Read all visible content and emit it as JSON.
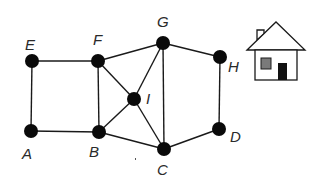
{
  "diagram": {
    "type": "graph",
    "nodes": [
      {
        "id": "E",
        "label": "E",
        "x": 32,
        "y": 61,
        "lx": 25,
        "ly": 50
      },
      {
        "id": "F",
        "label": "F",
        "x": 98,
        "y": 61,
        "lx": 93,
        "ly": 45
      },
      {
        "id": "G",
        "label": "G",
        "x": 163,
        "y": 43,
        "lx": 157,
        "ly": 27
      },
      {
        "id": "H",
        "label": "H",
        "x": 220,
        "y": 57,
        "lx": 228,
        "ly": 72
      },
      {
        "id": "I",
        "label": "I",
        "x": 134,
        "y": 99,
        "lx": 146,
        "ly": 104
      },
      {
        "id": "A",
        "label": "A",
        "x": 31,
        "y": 131,
        "lx": 22,
        "ly": 159
      },
      {
        "id": "B",
        "label": "B",
        "x": 99,
        "y": 132,
        "lx": 89,
        "ly": 157
      },
      {
        "id": "C",
        "label": "C",
        "x": 164,
        "y": 149,
        "lx": 157,
        "ly": 175
      },
      {
        "id": "D",
        "label": "D",
        "x": 219,
        "y": 129,
        "lx": 230,
        "ly": 142
      }
    ],
    "edges": [
      [
        "E",
        "F"
      ],
      [
        "E",
        "A"
      ],
      [
        "A",
        "B"
      ],
      [
        "F",
        "B"
      ],
      [
        "F",
        "G"
      ],
      [
        "F",
        "I"
      ],
      [
        "B",
        "I"
      ],
      [
        "B",
        "C"
      ],
      [
        "G",
        "I"
      ],
      [
        "I",
        "C"
      ],
      [
        "G",
        "C"
      ],
      [
        "G",
        "H"
      ],
      [
        "H",
        "D"
      ],
      [
        "D",
        "C"
      ]
    ],
    "house": {
      "icon": "house-icon",
      "roof_color": "#ffffff",
      "window_color": "#7a7a7a",
      "door_color": "#111111"
    }
  }
}
